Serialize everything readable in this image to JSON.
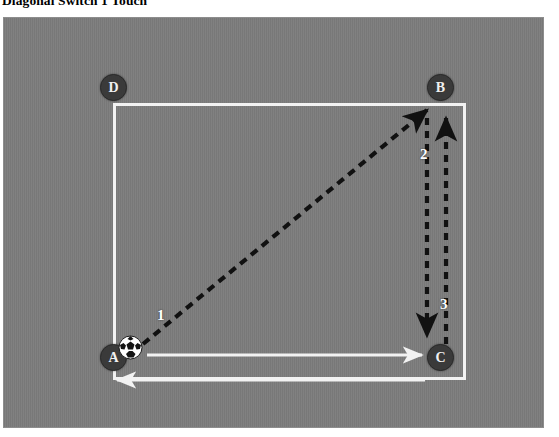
{
  "title": "Diagonal Switch 1 Touch",
  "field": {
    "background_color": "#7c7c7c",
    "box_color": "#f2f2f2"
  },
  "markers": [
    {
      "id": "d",
      "label": "D",
      "position": "top-left"
    },
    {
      "id": "b",
      "label": "B",
      "position": "top-right"
    },
    {
      "id": "a",
      "label": "A",
      "position": "bottom-left"
    },
    {
      "id": "c",
      "label": "C",
      "position": "bottom-right"
    }
  ],
  "ball": {
    "name": "soccer-ball",
    "at_marker": "A"
  },
  "movements": [
    {
      "number": "1",
      "style": "dashed",
      "color": "#111111",
      "from": "A",
      "to": "B",
      "kind": "pass-diagonal"
    },
    {
      "number": "2",
      "style": "dashed",
      "color": "#111111",
      "from": "B",
      "to": "C",
      "kind": "pass-vertical-down"
    },
    {
      "number": "3",
      "style": "dashed",
      "color": "#111111",
      "from": "C",
      "to": "B",
      "kind": "run-vertical-up"
    },
    {
      "number": "",
      "style": "solid",
      "color": "#f2f2f2",
      "from": "A",
      "to": "C",
      "kind": "run-horizontal-right"
    },
    {
      "number": "",
      "style": "solid",
      "color": "#f2f2f2",
      "from": "C",
      "to": "A",
      "kind": "run-horizontal-left-outside"
    }
  ],
  "labels": {
    "one": "1",
    "two": "2",
    "three": "3"
  }
}
